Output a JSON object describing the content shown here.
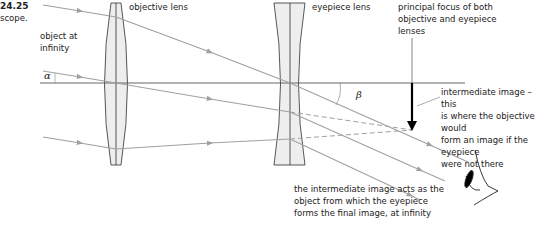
{
  "figure": {
    "number": "24.25",
    "caption_fragment": "scope."
  },
  "labels": {
    "object_at_infinity": [
      "object at",
      "infinity"
    ],
    "objective_lens": "objective lens",
    "eyepiece_lens": "eyepiece lens",
    "principal_focus": [
      "principal focus of both",
      "objective and eyepiece",
      "lenses"
    ],
    "intermediate_image": [
      "intermediate image – this",
      "is where the objective would",
      "form an image if the eyepiece",
      "were not there"
    ],
    "intermediate_acts": [
      "the intermediate image acts as the",
      "object from which the eyepiece",
      "forms the final image, at infinity"
    ],
    "alpha": "α",
    "beta": "β"
  },
  "colors": {
    "ray": "#a0a0a0",
    "axis": "#555555",
    "lens_fill": "#eeeeee",
    "lens_stroke": "#444444",
    "image_arrow": "#000000",
    "text": "#222222"
  }
}
